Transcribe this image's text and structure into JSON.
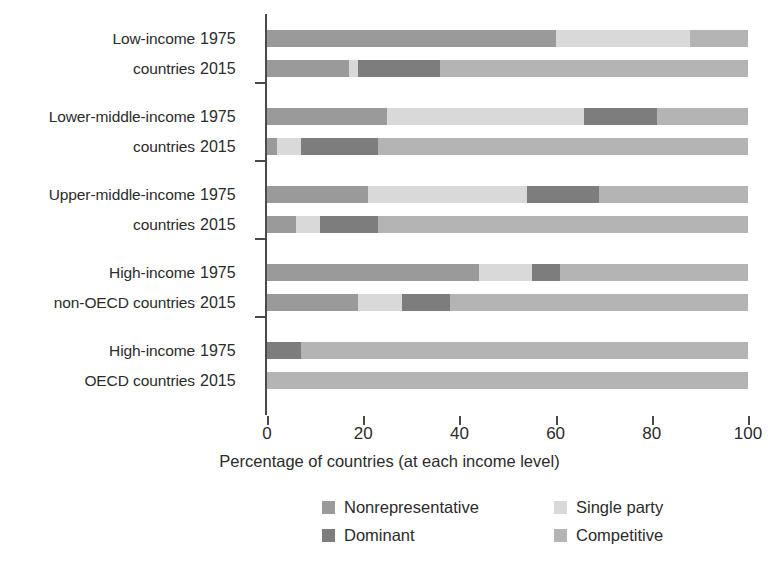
{
  "chart_data": {
    "type": "bar",
    "orientation": "horizontal",
    "stacked": true,
    "normalized_percent": true,
    "title": "",
    "xlabel": "Percentage of countries (at each income level)",
    "ylabel": "",
    "xlim": [
      0,
      100
    ],
    "xticks": [
      0,
      20,
      40,
      60,
      80,
      100
    ],
    "xtick_labels": [
      "0",
      "20",
      "40",
      "60",
      "80",
      "100"
    ],
    "grid": false,
    "legend_position": "bottom",
    "series": [
      {
        "name": "Nonrepresentative",
        "color": "#9a9a9a"
      },
      {
        "name": "Single party",
        "color": "#d9d9d9"
      },
      {
        "name": "Dominant",
        "color": "#7d7d7d"
      },
      {
        "name": "Competitive",
        "color": "#b4b4b4"
      }
    ],
    "categories": [
      "Low-income countries",
      "Lower-middle-income countries",
      "Upper-middle-income countries",
      "High-income non-OECD countries",
      "High-income OECD countries"
    ],
    "groups": [
      {
        "label": "Low-income\ncountries",
        "rows": [
          {
            "year": "1975",
            "values": {
              "Nonrepresentative": 60,
              "Single party": 28,
              "Dominant": 0,
              "Competitive": 12
            }
          },
          {
            "year": "2015",
            "values": {
              "Nonrepresentative": 17,
              "Single party": 2,
              "Dominant": 17,
              "Competitive": 64
            }
          }
        ]
      },
      {
        "label": "Lower-middle-income\ncountries",
        "rows": [
          {
            "year": "1975",
            "values": {
              "Nonrepresentative": 25,
              "Single party": 41,
              "Dominant": 15,
              "Competitive": 19
            }
          },
          {
            "year": "2015",
            "values": {
              "Nonrepresentative": 2,
              "Single party": 5,
              "Dominant": 16,
              "Competitive": 77
            }
          }
        ]
      },
      {
        "label": "Upper-middle-income\ncountries",
        "rows": [
          {
            "year": "1975",
            "values": {
              "Nonrepresentative": 21,
              "Single party": 33,
              "Dominant": 15,
              "Competitive": 31
            }
          },
          {
            "year": "2015",
            "values": {
              "Nonrepresentative": 6,
              "Single party": 5,
              "Dominant": 12,
              "Competitive": 77
            }
          }
        ]
      },
      {
        "label": "High-income\nnon-OECD countries",
        "rows": [
          {
            "year": "1975",
            "values": {
              "Nonrepresentative": 44,
              "Single party": 11,
              "Dominant": 6,
              "Competitive": 39
            }
          },
          {
            "year": "2015",
            "values": {
              "Nonrepresentative": 19,
              "Single party": 9,
              "Dominant": 10,
              "Competitive": 62
            }
          }
        ]
      },
      {
        "label": "High-income\nOECD countries",
        "rows": [
          {
            "year": "1975",
            "values": {
              "Nonrepresentative": 0,
              "Single party": 0,
              "Dominant": 7,
              "Competitive": 93
            }
          },
          {
            "year": "2015",
            "values": {
              "Nonrepresentative": 0,
              "Single party": 0,
              "Dominant": 0,
              "Competitive": 100
            }
          }
        ]
      }
    ]
  },
  "legend": {
    "items": [
      {
        "label": "Nonrepresentative",
        "color": "#9a9a9a"
      },
      {
        "label": "Dominant",
        "color": "#7d7d7d"
      },
      {
        "label": "Single party",
        "color": "#d9d9d9"
      },
      {
        "label": "Competitive",
        "color": "#b4b4b4"
      }
    ]
  },
  "axis": {
    "x_title": "Percentage of countries (at each income level)",
    "x_tick_labels": [
      "0",
      "20",
      "40",
      "60",
      "80",
      "100"
    ]
  }
}
